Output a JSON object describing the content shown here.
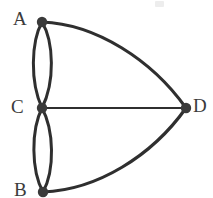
{
  "figure": {
    "name": "undirected-multigraph",
    "width": 213,
    "height": 198,
    "background_color": "#ffffff",
    "stroke_color": "#2f2f2f",
    "node_color": "#3a3a3a",
    "label_color": "#3b3b3b"
  },
  "vertices": [
    {
      "id": "A",
      "label": "A",
      "cx": 42,
      "cy": 22,
      "r": 5.2,
      "label_x": 13,
      "label_y": 9
    },
    {
      "id": "C",
      "label": "C",
      "cx": 42,
      "cy": 108,
      "r": 5.2,
      "label_x": 11,
      "label_y": 97
    },
    {
      "id": "B",
      "label": "B",
      "cx": 43,
      "cy": 192,
      "r": 5.2,
      "label_x": 14,
      "label_y": 180
    },
    {
      "id": "D",
      "label": "D",
      "cx": 186,
      "cy": 108,
      "r": 5.2,
      "label_x": 193,
      "label_y": 96
    }
  ],
  "edges": [
    {
      "id": "A-C-left",
      "from": "A",
      "to": "C",
      "style": "curve-left",
      "stroke_width": 3.0
    },
    {
      "id": "A-C-right",
      "from": "A",
      "to": "C",
      "style": "curve-right",
      "stroke_width": 3.0
    },
    {
      "id": "C-B-left",
      "from": "C",
      "to": "B",
      "style": "curve-left",
      "stroke_width": 3.0
    },
    {
      "id": "C-B-right",
      "from": "C",
      "to": "B",
      "style": "curve-right",
      "stroke_width": 3.0
    },
    {
      "id": "A-D",
      "from": "A",
      "to": "D",
      "style": "arc-outward",
      "stroke_width": 3.2
    },
    {
      "id": "B-D",
      "from": "B",
      "to": "D",
      "style": "arc-outward",
      "stroke_width": 3.2
    },
    {
      "id": "C-D",
      "from": "C",
      "to": "D",
      "style": "straight",
      "stroke_width": 2.0
    }
  ],
  "paths": {
    "ac_left": "M 42 22 C 31 42, 30 82, 42 108",
    "ac_right": "M 42 22 C 54 42, 55 82, 42 108",
    "cb_left": "M 42 108 C 31 130, 31 170, 43 192",
    "cb_right": "M 42 108 C 54 130, 55 170, 43 192",
    "ad": "M 42 22 C 96 24, 152 60, 186 108",
    "bd": "M 43 192 C 97 190, 152 156, 186 108",
    "cd": "M 42 108 L 186 108"
  },
  "artifact": {
    "x": 155,
    "y": 1,
    "w": 9,
    "h": 6
  }
}
